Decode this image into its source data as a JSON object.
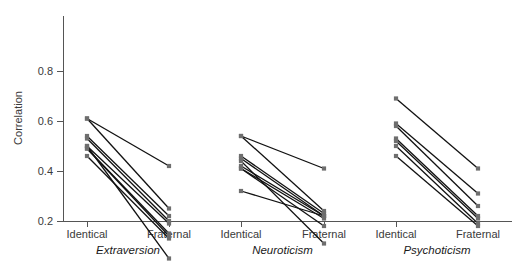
{
  "chart_data": {
    "type": "line",
    "title": "",
    "xlabel": "",
    "ylabel": "Correlation",
    "ylim": [
      0.0,
      0.85
    ],
    "yticks": [
      0.2,
      0.4,
      0.6,
      0.8
    ],
    "ytick_labels": [
      "0.2",
      "0.4",
      "0.6",
      "0.8"
    ],
    "grid": false,
    "legend": "none",
    "x_categories": [
      "Identical",
      "Fraternal"
    ],
    "panels": [
      {
        "name": "Extraversion",
        "x_tick_labels": [
          "Identical",
          "Fraternal"
        ],
        "series": [
          {
            "name": "study-1",
            "values": [
              0.61,
              0.42
            ]
          },
          {
            "name": "study-2",
            "values": [
              0.61,
              0.25
            ]
          },
          {
            "name": "study-3",
            "values": [
              0.54,
              0.22
            ]
          },
          {
            "name": "study-4",
            "values": [
              0.53,
              0.2
            ]
          },
          {
            "name": "study-5",
            "values": [
              0.5,
              0.19
            ]
          },
          {
            "name": "study-6",
            "values": [
              0.49,
              0.15
            ]
          },
          {
            "name": "study-7",
            "values": [
              0.49,
              0.14
            ]
          },
          {
            "name": "study-8",
            "values": [
              0.46,
              0.13
            ]
          },
          {
            "name": "study-9",
            "values": [
              0.5,
              0.05
            ]
          }
        ]
      },
      {
        "name": "Neuroticism",
        "x_tick_labels": [
          "Identical",
          "Fraternal"
        ],
        "series": [
          {
            "name": "study-1",
            "values": [
              0.54,
              0.41
            ]
          },
          {
            "name": "study-2",
            "values": [
              0.54,
              0.24
            ]
          },
          {
            "name": "study-3",
            "values": [
              0.46,
              0.23
            ]
          },
          {
            "name": "study-4",
            "values": [
              0.45,
              0.22
            ]
          },
          {
            "name": "study-5",
            "values": [
              0.42,
              0.22
            ]
          },
          {
            "name": "study-6",
            "values": [
              0.41,
              0.21
            ]
          },
          {
            "name": "study-7",
            "values": [
              0.41,
              0.18
            ]
          },
          {
            "name": "study-8",
            "values": [
              0.44,
              0.11
            ]
          },
          {
            "name": "study-9",
            "values": [
              0.32,
              0.22
            ]
          }
        ]
      },
      {
        "name": "Psychoticism",
        "x_tick_labels": [
          "Identical",
          "Fraternal"
        ],
        "series": [
          {
            "name": "study-1",
            "values": [
              0.69,
              0.41
            ]
          },
          {
            "name": "study-2",
            "values": [
              0.59,
              0.31
            ]
          },
          {
            "name": "study-3",
            "values": [
              0.58,
              0.26
            ]
          },
          {
            "name": "study-4",
            "values": [
              0.53,
              0.22
            ]
          },
          {
            "name": "study-5",
            "values": [
              0.52,
              0.21
            ]
          },
          {
            "name": "study-6",
            "values": [
              0.5,
              0.19
            ]
          },
          {
            "name": "study-7",
            "values": [
              0.46,
              0.18
            ]
          }
        ]
      }
    ]
  },
  "layout": {
    "plot_top_y": 14,
    "plot_bottom_y": 221,
    "axis_y": 221,
    "y_axis_x": 63,
    "y_axis_top": 16,
    "value_to_y": {
      "zero_y": 271,
      "pixels_per_unit": 250
    },
    "panel_tick_x": [
      [
        87,
        169
      ],
      [
        241,
        324
      ],
      [
        396,
        478
      ]
    ],
    "panel_label_y": 254,
    "xtick_label_y": 238,
    "marker_size": 4.2
  }
}
